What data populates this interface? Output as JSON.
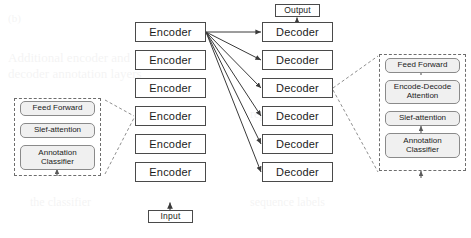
{
  "diagram": {
    "colors": {
      "background": "#ffffff",
      "node_border": "#4a4a4a",
      "node_fill": "#ffffff",
      "callout_border": "#6d6d6d",
      "subblock_border": "#8a8a8a",
      "subblock_fill": "#f0f0f0",
      "wire": "#3a3a3a",
      "dashed_wire": "#8f8f8f",
      "text": "#1b1b1b"
    },
    "encoder_label": "Encoder",
    "decoder_label": "Decoder",
    "encoder_stack": [
      {
        "label": "Encoder"
      },
      {
        "label": "Encoder"
      },
      {
        "label": "Encoder"
      },
      {
        "label": "Encoder"
      },
      {
        "label": "Encoder"
      },
      {
        "label": "Encoder"
      }
    ],
    "decoder_stack": [
      {
        "label": "Decoder"
      },
      {
        "label": "Decoder"
      },
      {
        "label": "Decoder"
      },
      {
        "label": "Decoder"
      },
      {
        "label": "Decoder"
      },
      {
        "label": "Decoder"
      }
    ],
    "io": {
      "input_label": "Input",
      "output_label": "Output"
    },
    "encoder_detail": {
      "blocks": [
        {
          "label": "Feed Forward"
        },
        {
          "label": "Slef-attention"
        },
        {
          "label": "Annotation\nClassifier"
        }
      ]
    },
    "decoder_detail": {
      "blocks": [
        {
          "label": "Feed Forward"
        },
        {
          "label": "Encode-Decode\nAttention"
        },
        {
          "label": "Slef-attention"
        },
        {
          "label": "Annotation\nClassifier"
        }
      ]
    }
  }
}
